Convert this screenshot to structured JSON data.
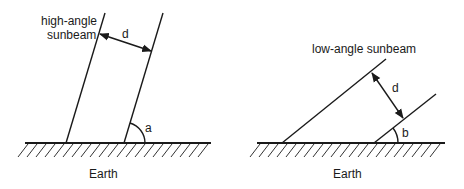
{
  "diagrams": [
    {
      "id": "high",
      "title_lines": [
        "high-angle",
        "sunbeam"
      ],
      "distance_label": "d",
      "angle_label": "a",
      "surface_label": "Earth"
    },
    {
      "id": "low",
      "title_lines": [
        "low-angle sunbeam"
      ],
      "distance_label": "d",
      "angle_label": "b",
      "surface_label": "Earth"
    }
  ],
  "colors": {
    "ink": "#1a1a1a",
    "background": "#ffffff"
  }
}
